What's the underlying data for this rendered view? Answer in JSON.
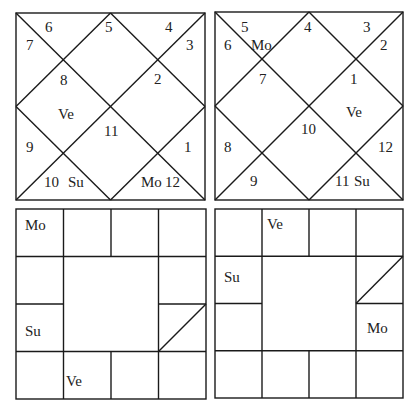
{
  "north_charts": [
    {
      "name": "rasi-chart-north",
      "box": [
        16,
        13,
        205,
        200
      ],
      "labels": [
        {
          "t": "6",
          "x": 45,
          "y": 32
        },
        {
          "t": "7",
          "x": 26,
          "y": 50
        },
        {
          "t": "5",
          "x": 105,
          "y": 32
        },
        {
          "t": "4",
          "x": 165,
          "y": 32
        },
        {
          "t": "3",
          "x": 186,
          "y": 50
        },
        {
          "t": "8",
          "x": 60,
          "y": 85
        },
        {
          "t": "2",
          "x": 154,
          "y": 84
        },
        {
          "t": "Ve",
          "x": 58,
          "y": 119
        },
        {
          "t": "11",
          "x": 104,
          "y": 136
        },
        {
          "t": "9",
          "x": 26,
          "y": 152
        },
        {
          "t": "1",
          "x": 184,
          "y": 152
        },
        {
          "t": "10",
          "x": 44,
          "y": 187
        },
        {
          "t": "Su",
          "x": 68,
          "y": 187
        },
        {
          "t": "Mo",
          "x": 141,
          "y": 187
        },
        {
          "t": "12",
          "x": 165,
          "y": 187
        }
      ]
    },
    {
      "name": "navamsa-chart-north",
      "box": [
        215,
        12,
        403,
        200
      ],
      "labels": [
        {
          "t": "5",
          "x": 241,
          "y": 32
        },
        {
          "t": "6",
          "x": 224,
          "y": 50
        },
        {
          "t": "Mo",
          "x": 251,
          "y": 50
        },
        {
          "t": "4",
          "x": 304,
          "y": 32
        },
        {
          "t": "3",
          "x": 363,
          "y": 32
        },
        {
          "t": "2",
          "x": 380,
          "y": 50
        },
        {
          "t": "7",
          "x": 259,
          "y": 84
        },
        {
          "t": "1",
          "x": 350,
          "y": 84
        },
        {
          "t": "Ve",
          "x": 346,
          "y": 117
        },
        {
          "t": "10",
          "x": 301,
          "y": 134
        },
        {
          "t": "8",
          "x": 224,
          "y": 152
        },
        {
          "t": "12",
          "x": 378,
          "y": 152
        },
        {
          "t": "9",
          "x": 250,
          "y": 186
        },
        {
          "t": "11",
          "x": 335,
          "y": 186
        },
        {
          "t": "Su",
          "x": 354,
          "y": 186
        }
      ]
    }
  ],
  "south_charts": [
    {
      "name": "rasi-chart-south",
      "box": [
        16,
        209,
        206,
        399
      ],
      "slash_cell": [
        3,
        2
      ],
      "labels": [
        {
          "t": "Mo",
          "x": 25,
          "y": 230
        },
        {
          "t": "Su",
          "x": 25,
          "y": 336
        },
        {
          "t": "Ve",
          "x": 66,
          "y": 386
        }
      ]
    },
    {
      "name": "navamsa-chart-south",
      "box": [
        215,
        209,
        403,
        398
      ],
      "slash_cell": [
        3,
        1
      ],
      "labels": [
        {
          "t": "Ve",
          "x": 267,
          "y": 229
        },
        {
          "t": "Su",
          "x": 224,
          "y": 282
        },
        {
          "t": "Mo",
          "x": 367,
          "y": 333
        }
      ]
    }
  ]
}
